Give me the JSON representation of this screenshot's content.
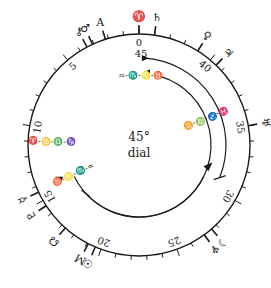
{
  "dial": {
    "title_line1": "45°",
    "title_line2": "dial",
    "center": [
      139,
      145
    ],
    "outer_radius": 111,
    "degrees_total": 45,
    "scale_labels": [
      "0",
      "5",
      "10",
      "15",
      "20",
      "25",
      "30",
      "35",
      "40"
    ],
    "top_inner_label": "45",
    "ink_color": "#1a1a1a",
    "background": "#ffffff"
  },
  "planets": [
    {
      "glyph": "♈",
      "name": "aries",
      "deg": 0
    },
    {
      "glyph": "♄",
      "name": "saturn",
      "deg": 44
    },
    {
      "glyph": "A",
      "name": "ascendant",
      "deg": 2.2
    },
    {
      "glyph": "♂",
      "name": "mars",
      "deg": 3.1
    },
    {
      "glyph": "⚷",
      "name": "node-small",
      "deg": 3.5
    },
    {
      "glyph": "♀",
      "name": "venus",
      "deg": 41
    },
    {
      "glyph": "♃",
      "name": "jupiter",
      "deg": 39.5
    },
    {
      "glyph": "♅",
      "name": "uranus",
      "deg": 35
    },
    {
      "glyph": "♆",
      "name": "neptune",
      "deg": 27
    },
    {
      "glyph": "☽",
      "name": "moon",
      "deg": 27.6
    },
    {
      "glyph": "☉",
      "name": "sun",
      "deg": 19.6
    },
    {
      "glyph": "M",
      "name": "midheaven",
      "deg": 19.1
    },
    {
      "glyph": "☊",
      "name": "node",
      "deg": 17.3
    },
    {
      "glyph": "♇",
      "name": "pluto",
      "deg": 15.4
    },
    {
      "glyph": "☿",
      "name": "mercury",
      "deg": 14.4
    }
  ],
  "arcs": {
    "outer_arc_signs_upper": "≈-♏-♌-♉",
    "outer_arc_signs_right": "♓-♐-♍-♊",
    "outer_arc_signs_left": "♈-♋-♎-♑",
    "inner_arc_signs_lower": "♉-♌-♏-≈",
    "inner_arc_signs_left": "♈-♋-♎-♑"
  }
}
